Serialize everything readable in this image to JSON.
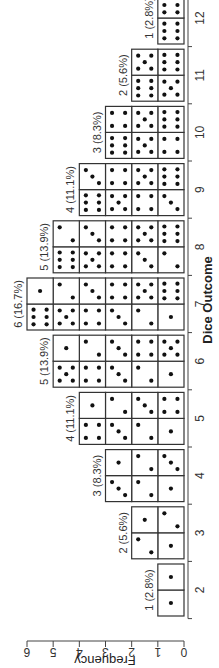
{
  "chart_data": {
    "type": "bar",
    "title": "",
    "xlabel": "Dice Outcome",
    "ylabel": "Frequency",
    "ylim": [
      0,
      6
    ],
    "yticks": [
      0,
      1,
      2,
      3,
      4,
      5,
      6
    ],
    "grid": false,
    "legend": null,
    "categories": [
      "2",
      "3",
      "4",
      "5",
      "6",
      "7",
      "8",
      "9",
      "10",
      "11",
      "12"
    ],
    "values": [
      1,
      2,
      3,
      4,
      5,
      6,
      5,
      4,
      3,
      2,
      1
    ],
    "percent_labels": [
      "1 (2.8%)",
      "2 (5.6%)",
      "3 (8.3%)",
      "4 (11.1%)",
      "5 (13.9%)",
      "6 (16.7%)",
      "5 (13.9%)",
      "4 (11.1%)",
      "3 (8.3%)",
      "2 (5.6%)",
      "1 (2.8%)"
    ],
    "bar_contents": [
      [
        [
          1,
          1
        ]
      ],
      [
        [
          1,
          2
        ],
        [
          2,
          1
        ]
      ],
      [
        [
          1,
          3
        ],
        [
          2,
          2
        ],
        [
          3,
          1
        ]
      ],
      [
        [
          1,
          4
        ],
        [
          2,
          3
        ],
        [
          3,
          2
        ],
        [
          4,
          1
        ]
      ],
      [
        [
          1,
          5
        ],
        [
          2,
          4
        ],
        [
          3,
          3
        ],
        [
          4,
          2
        ],
        [
          5,
          1
        ]
      ],
      [
        [
          1,
          6
        ],
        [
          2,
          5
        ],
        [
          3,
          4
        ],
        [
          4,
          3
        ],
        [
          5,
          2
        ],
        [
          6,
          1
        ]
      ],
      [
        [
          2,
          6
        ],
        [
          3,
          5
        ],
        [
          4,
          4
        ],
        [
          5,
          3
        ],
        [
          6,
          2
        ]
      ],
      [
        [
          3,
          6
        ],
        [
          4,
          5
        ],
        [
          5,
          4
        ],
        [
          6,
          3
        ]
      ],
      [
        [
          4,
          6
        ],
        [
          5,
          5
        ],
        [
          6,
          4
        ]
      ],
      [
        [
          5,
          6
        ],
        [
          6,
          5
        ]
      ],
      [
        [
          6,
          6
        ]
      ]
    ],
    "orientation_note": "rendered rotated 90 degrees counter-clockwise"
  }
}
